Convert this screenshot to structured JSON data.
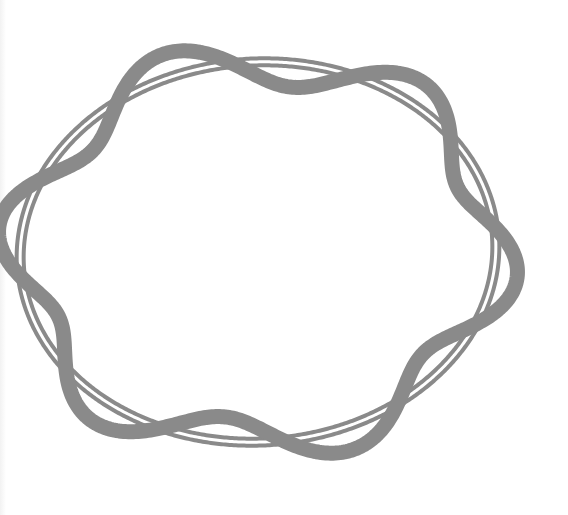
{
  "diagram": {
    "title": "",
    "wavelengths_around_orbit": 6,
    "ring_count": 2,
    "colors": {
      "stroke": "#8a8a8a",
      "background": "#ffffff"
    }
  }
}
